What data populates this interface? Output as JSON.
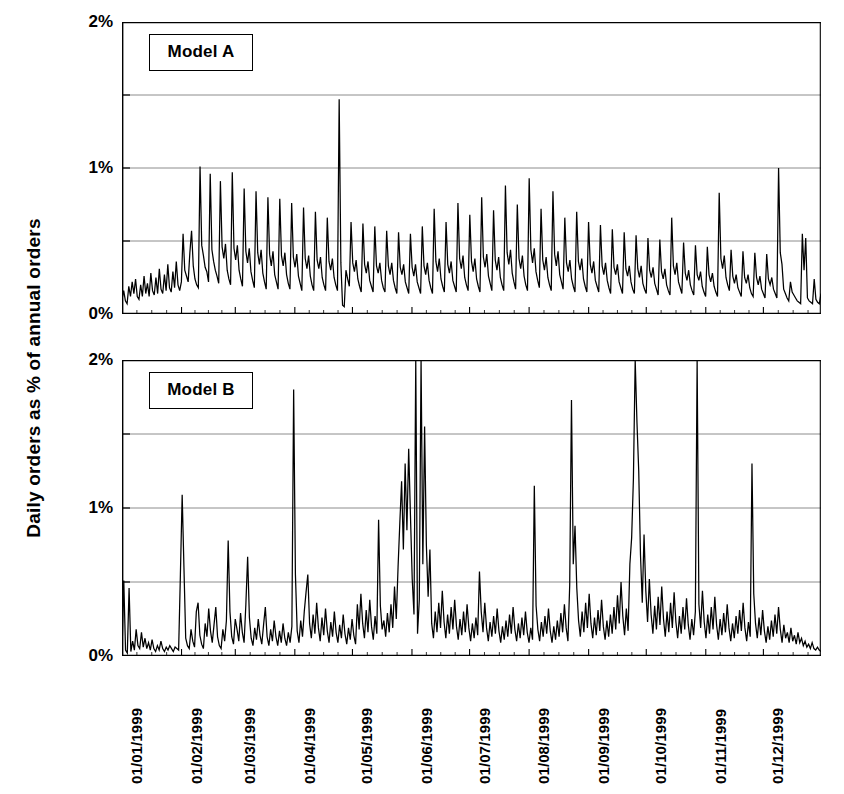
{
  "axis": {
    "ylabel": "Daily orders as % of annual orders",
    "ytick_labels": [
      "0%",
      "1%",
      "2%"
    ],
    "ytick_values": [
      0,
      1,
      2
    ],
    "gridline_values": [
      0,
      0.5,
      1,
      1.5,
      2
    ],
    "ymin": 0,
    "ymax": 2,
    "xtick_labels": [
      "01/01/1999",
      "01/02/1999",
      "01/03/1999",
      "01/04/1999",
      "01/05/1999",
      "01/06/1999",
      "01/07/1999",
      "01/08/1999",
      "01/09/1999",
      "01/10/1999",
      "01/11/1999",
      "01/12/1999"
    ],
    "xtick_positions": [
      0,
      31,
      59,
      90,
      120,
      151,
      181,
      212,
      243,
      273,
      304,
      334
    ],
    "x_total_days": 365
  },
  "panels": [
    {
      "id": "model-a",
      "caption": "Model A"
    },
    {
      "id": "model-b",
      "caption": "Model B"
    }
  ],
  "colors": {
    "line": "#000000",
    "grid": "#808080",
    "axis": "#000000",
    "background": "#ffffff"
  },
  "chart_data": [
    {
      "type": "line",
      "title": "Model A",
      "xlabel": "",
      "ylabel": "Daily orders as % of annual orders",
      "xlim": [
        "01/01/1999",
        "31/12/1999"
      ],
      "ylim": [
        0,
        2
      ],
      "grid": true,
      "legend": "none",
      "annotations": [
        "Model A"
      ],
      "x_unit": "day of year 1999",
      "series_name": "Model A daily orders (% of annual)",
      "values": [
        0.1,
        0.16,
        0.09,
        0.07,
        0.19,
        0.12,
        0.22,
        0.14,
        0.24,
        0.12,
        0.1,
        0.2,
        0.12,
        0.26,
        0.14,
        0.21,
        0.12,
        0.28,
        0.16,
        0.13,
        0.25,
        0.14,
        0.31,
        0.17,
        0.14,
        0.27,
        0.16,
        0.34,
        0.18,
        0.15,
        0.29,
        0.18,
        0.36,
        0.2,
        0.16,
        0.22,
        0.55,
        0.3,
        0.26,
        0.22,
        0.42,
        0.57,
        0.33,
        0.24,
        0.2,
        0.18,
        1.01,
        0.47,
        0.4,
        0.32,
        0.29,
        0.22,
        0.96,
        0.44,
        0.36,
        0.3,
        0.26,
        0.21,
        0.91,
        0.46,
        0.38,
        0.48,
        0.3,
        0.24,
        0.2,
        0.97,
        0.45,
        0.37,
        0.47,
        0.3,
        0.24,
        0.19,
        0.86,
        0.43,
        0.35,
        0.45,
        0.29,
        0.23,
        0.18,
        0.84,
        0.42,
        0.34,
        0.44,
        0.28,
        0.22,
        0.17,
        0.8,
        0.41,
        0.33,
        0.43,
        0.27,
        0.22,
        0.17,
        0.79,
        0.4,
        0.33,
        0.42,
        0.27,
        0.21,
        0.17,
        0.76,
        0.39,
        0.32,
        0.41,
        0.26,
        0.21,
        0.16,
        0.73,
        0.38,
        0.31,
        0.4,
        0.26,
        0.2,
        0.16,
        0.7,
        0.37,
        0.31,
        0.39,
        0.25,
        0.2,
        0.16,
        0.66,
        0.36,
        0.3,
        0.38,
        0.25,
        0.2,
        0.16,
        1.47,
        0.35,
        0.06,
        0.05,
        0.3,
        0.24,
        0.19,
        0.63,
        0.35,
        0.29,
        0.37,
        0.24,
        0.19,
        0.15,
        0.62,
        0.34,
        0.28,
        0.36,
        0.23,
        0.19,
        0.15,
        0.6,
        0.33,
        0.28,
        0.35,
        0.23,
        0.18,
        0.15,
        0.57,
        0.33,
        0.27,
        0.35,
        0.23,
        0.18,
        0.14,
        0.56,
        0.32,
        0.27,
        0.34,
        0.22,
        0.18,
        0.14,
        0.55,
        0.32,
        0.26,
        0.34,
        0.22,
        0.18,
        0.14,
        0.6,
        0.33,
        0.27,
        0.35,
        0.23,
        0.18,
        0.14,
        0.72,
        0.36,
        0.29,
        0.38,
        0.24,
        0.19,
        0.15,
        0.63,
        0.34,
        0.28,
        0.36,
        0.23,
        0.19,
        0.15,
        0.76,
        0.38,
        0.31,
        0.4,
        0.25,
        0.2,
        0.16,
        0.68,
        0.36,
        0.29,
        0.38,
        0.24,
        0.19,
        0.15,
        0.8,
        0.39,
        0.32,
        0.41,
        0.26,
        0.21,
        0.16,
        0.71,
        0.37,
        0.3,
        0.39,
        0.25,
        0.2,
        0.16,
        0.88,
        0.42,
        0.34,
        0.44,
        0.28,
        0.22,
        0.17,
        0.75,
        0.38,
        0.31,
        0.4,
        0.26,
        0.2,
        0.16,
        0.93,
        0.44,
        0.35,
        0.45,
        0.29,
        0.23,
        0.18,
        0.72,
        0.37,
        0.3,
        0.39,
        0.25,
        0.2,
        0.16,
        0.84,
        0.41,
        0.33,
        0.43,
        0.27,
        0.22,
        0.17,
        0.66,
        0.35,
        0.29,
        0.37,
        0.24,
        0.19,
        0.15,
        0.7,
        0.36,
        0.3,
        0.38,
        0.24,
        0.19,
        0.15,
        0.63,
        0.34,
        0.28,
        0.36,
        0.23,
        0.19,
        0.15,
        0.61,
        0.33,
        0.27,
        0.35,
        0.23,
        0.18,
        0.14,
        0.58,
        0.32,
        0.27,
        0.34,
        0.22,
        0.18,
        0.14,
        0.56,
        0.31,
        0.26,
        0.33,
        0.22,
        0.17,
        0.14,
        0.54,
        0.31,
        0.25,
        0.33,
        0.21,
        0.17,
        0.14,
        0.52,
        0.3,
        0.25,
        0.32,
        0.21,
        0.17,
        0.13,
        0.51,
        0.29,
        0.24,
        0.31,
        0.2,
        0.16,
        0.13,
        0.66,
        0.33,
        0.27,
        0.35,
        0.22,
        0.18,
        0.14,
        0.49,
        0.28,
        0.23,
        0.3,
        0.2,
        0.16,
        0.13,
        0.47,
        0.27,
        0.23,
        0.29,
        0.19,
        0.15,
        0.12,
        0.46,
        0.27,
        0.22,
        0.28,
        0.19,
        0.15,
        0.12,
        0.83,
        0.38,
        0.31,
        0.4,
        0.25,
        0.2,
        0.16,
        0.44,
        0.26,
        0.21,
        0.27,
        0.18,
        0.15,
        0.12,
        0.43,
        0.25,
        0.21,
        0.27,
        0.18,
        0.14,
        0.12,
        0.42,
        0.25,
        0.2,
        0.26,
        0.17,
        0.14,
        0.11,
        0.41,
        0.24,
        0.2,
        0.25,
        0.17,
        0.14,
        0.11,
        1.0,
        0.42,
        0.34,
        0.17,
        0.14,
        0.11,
        0.09,
        0.22,
        0.15,
        0.13,
        0.11,
        0.09,
        0.08,
        0.07,
        0.55,
        0.3,
        0.52,
        0.11,
        0.09,
        0.08,
        0.07,
        0.24,
        0.1,
        0.08,
        0.07,
        0.14
      ]
    },
    {
      "type": "line",
      "title": "Model B",
      "xlabel": "",
      "ylabel": "Daily orders as % of annual orders",
      "xlim": [
        "01/01/1999",
        "31/12/1999"
      ],
      "ylim": [
        0,
        2
      ],
      "grid": true,
      "legend": "none",
      "annotations": [
        "Model B"
      ],
      "x_unit": "day of year 1999",
      "series_name": "Model B daily orders (% of annual)",
      "values": [
        0.02,
        0.51,
        0.04,
        0.02,
        0.46,
        0.03,
        0.1,
        0.04,
        0.18,
        0.07,
        0.05,
        0.16,
        0.06,
        0.12,
        0.05,
        0.09,
        0.04,
        0.11,
        0.05,
        0.03,
        0.07,
        0.04,
        0.1,
        0.05,
        0.03,
        0.06,
        0.04,
        0.07,
        0.05,
        0.03,
        0.06,
        0.05,
        0.04,
        0.55,
        1.09,
        0.6,
        0.12,
        0.07,
        0.05,
        0.18,
        0.1,
        0.06,
        0.3,
        0.36,
        0.14,
        0.08,
        0.05,
        0.22,
        0.13,
        0.32,
        0.17,
        0.09,
        0.21,
        0.33,
        0.13,
        0.07,
        0.05,
        0.18,
        0.1,
        0.24,
        0.78,
        0.3,
        0.13,
        0.08,
        0.25,
        0.18,
        0.1,
        0.29,
        0.16,
        0.09,
        0.35,
        0.67,
        0.26,
        0.12,
        0.07,
        0.19,
        0.11,
        0.25,
        0.14,
        0.08,
        0.21,
        0.33,
        0.13,
        0.07,
        0.18,
        0.1,
        0.24,
        0.13,
        0.07,
        0.17,
        0.09,
        0.22,
        0.12,
        0.07,
        0.16,
        0.09,
        0.2,
        1.8,
        0.55,
        0.17,
        0.09,
        0.24,
        0.13,
        0.3,
        0.43,
        0.55,
        0.22,
        0.12,
        0.28,
        0.15,
        0.36,
        0.19,
        0.1,
        0.26,
        0.14,
        0.32,
        0.17,
        0.09,
        0.23,
        0.13,
        0.3,
        0.16,
        0.09,
        0.21,
        0.12,
        0.28,
        0.15,
        0.08,
        0.19,
        0.11,
        0.25,
        0.14,
        0.08,
        0.35,
        0.18,
        0.42,
        0.22,
        0.12,
        0.31,
        0.16,
        0.38,
        0.2,
        0.11,
        0.27,
        0.15,
        0.92,
        0.34,
        0.18,
        0.24,
        0.13,
        0.29,
        0.16,
        0.35,
        0.19,
        0.47,
        0.25,
        0.6,
        0.9,
        1.18,
        0.72,
        1.3,
        0.85,
        1.4,
        0.95,
        0.52,
        0.28,
        2.0,
        0.15,
        0.38,
        2.0,
        0.62,
        1.55,
        0.75,
        0.4,
        0.72,
        0.22,
        0.12,
        0.3,
        0.16,
        0.36,
        0.19,
        0.44,
        0.23,
        0.12,
        0.28,
        0.15,
        0.33,
        0.18,
        0.38,
        0.2,
        0.11,
        0.25,
        0.14,
        0.3,
        0.16,
        0.35,
        0.19,
        0.1,
        0.22,
        0.12,
        0.26,
        0.14,
        0.57,
        0.3,
        0.16,
        0.36,
        0.19,
        0.1,
        0.23,
        0.13,
        0.27,
        0.15,
        0.32,
        0.17,
        0.09,
        0.2,
        0.11,
        0.24,
        0.13,
        0.28,
        0.15,
        0.33,
        0.18,
        0.1,
        0.22,
        0.12,
        0.26,
        0.14,
        0.3,
        0.16,
        0.09,
        0.19,
        0.11,
        1.15,
        0.34,
        0.18,
        0.1,
        0.23,
        0.13,
        0.27,
        0.15,
        0.32,
        0.17,
        0.09,
        0.2,
        0.11,
        0.24,
        0.13,
        0.29,
        0.16,
        0.35,
        0.19,
        0.1,
        0.48,
        1.73,
        0.62,
        0.88,
        0.46,
        0.24,
        0.13,
        0.3,
        0.16,
        0.36,
        0.19,
        0.42,
        0.22,
        0.12,
        0.26,
        0.14,
        0.31,
        0.17,
        0.38,
        0.2,
        0.11,
        0.24,
        0.13,
        0.28,
        0.15,
        0.33,
        0.18,
        0.41,
        0.22,
        0.5,
        0.27,
        0.14,
        0.32,
        0.17,
        0.62,
        0.8,
        1.2,
        2.0,
        1.58,
        1.25,
        0.68,
        0.36,
        0.82,
        0.44,
        0.23,
        0.52,
        0.28,
        0.15,
        0.34,
        0.18,
        0.4,
        0.21,
        0.47,
        0.25,
        0.13,
        0.3,
        0.16,
        0.36,
        0.19,
        0.43,
        0.23,
        0.12,
        0.27,
        0.15,
        0.33,
        0.18,
        0.39,
        0.21,
        0.11,
        0.25,
        0.14,
        0.3,
        2.0,
        0.35,
        0.19,
        0.44,
        0.23,
        0.12,
        0.28,
        0.15,
        0.33,
        0.18,
        0.4,
        0.21,
        0.11,
        0.25,
        0.14,
        0.29,
        0.16,
        0.35,
        0.19,
        0.1,
        0.22,
        0.12,
        0.27,
        0.15,
        0.31,
        0.17,
        0.36,
        0.19,
        0.1,
        0.23,
        0.13,
        1.3,
        0.42,
        0.22,
        0.12,
        0.26,
        0.14,
        0.31,
        0.17,
        0.09,
        0.2,
        0.11,
        0.24,
        0.13,
        0.28,
        0.15,
        0.33,
        0.18,
        0.09,
        0.21,
        0.12,
        0.16,
        0.09,
        0.19,
        0.1,
        0.14,
        0.08,
        0.16,
        0.09,
        0.12,
        0.07,
        0.1,
        0.06,
        0.08,
        0.05,
        0.09,
        0.05,
        0.04,
        0.06,
        0.04,
        0.03
      ]
    }
  ]
}
